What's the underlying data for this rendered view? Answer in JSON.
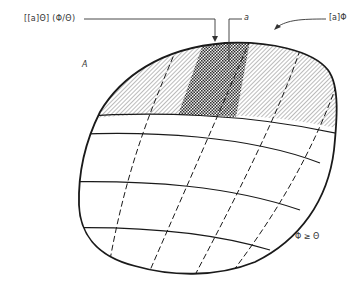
{
  "diagram": {
    "labels": {
      "left_pointer": "[[a]Θ] (Φ/Θ)",
      "middle_pointer": "a",
      "right_pointer": "[a]Φ",
      "region": "A",
      "inequality": "Φ ≥ Θ"
    },
    "regions": {
      "top_band": "diagonally hatched band along top of region A",
      "highlighted_cell": "cross-hatched (checkered) cell within top band"
    },
    "colors": {
      "stroke": "#1a1a1a",
      "text": "#333333",
      "background": "#ffffff"
    },
    "grid": {
      "solid_curves": 5,
      "dashed_curves": 4
    }
  }
}
